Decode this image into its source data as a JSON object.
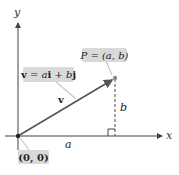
{
  "diagram": {
    "type": "vector-in-plane",
    "axes": {
      "x_label": "x",
      "y_label": "y"
    },
    "origin": {
      "label": "(0, 0)"
    },
    "point": {
      "label": "P = (a, b)"
    },
    "vector": {
      "name": "v",
      "equation_parts": {
        "lhs": "v",
        "eq": " = ",
        "a": "a",
        "i": "i",
        "plus": " + ",
        "b": "b",
        "j": "j"
      }
    },
    "components": {
      "horizontal": "a",
      "vertical": "b"
    },
    "colors": {
      "vector": "#555555",
      "axes": "#444444",
      "label_box": "#d9d9d9",
      "text": "#222222",
      "point": "#888888"
    }
  }
}
